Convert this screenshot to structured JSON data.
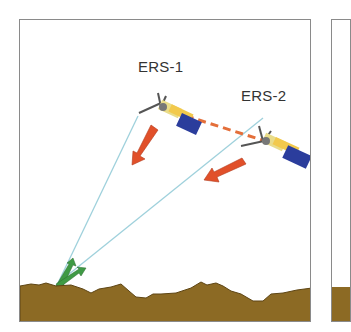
{
  "diagram": {
    "satellites": [
      {
        "name": "ERS-1",
        "label_x": 138,
        "label_y": 58
      },
      {
        "name": "ERS-2",
        "label_x": 241,
        "label_y": 87
      }
    ],
    "colors": {
      "frame": "#8a8a8a",
      "ground": "#8c6a24",
      "ground_edge": "#5e4514",
      "beam_line": "#9fd1dc",
      "transmit_arrow": "#e1502a",
      "return_arrow": "#3f9a45",
      "baseline": "#e46f3a",
      "satellite_body": "#2b3d9c",
      "satellite_bus": "#e9dc8a"
    },
    "annotations": {
      "baseline_style": "dashed",
      "description": "Two satellites (ERS-1, ERS-2) transmitting radar beams toward the same ground point; returns shown as green arrows."
    }
  }
}
